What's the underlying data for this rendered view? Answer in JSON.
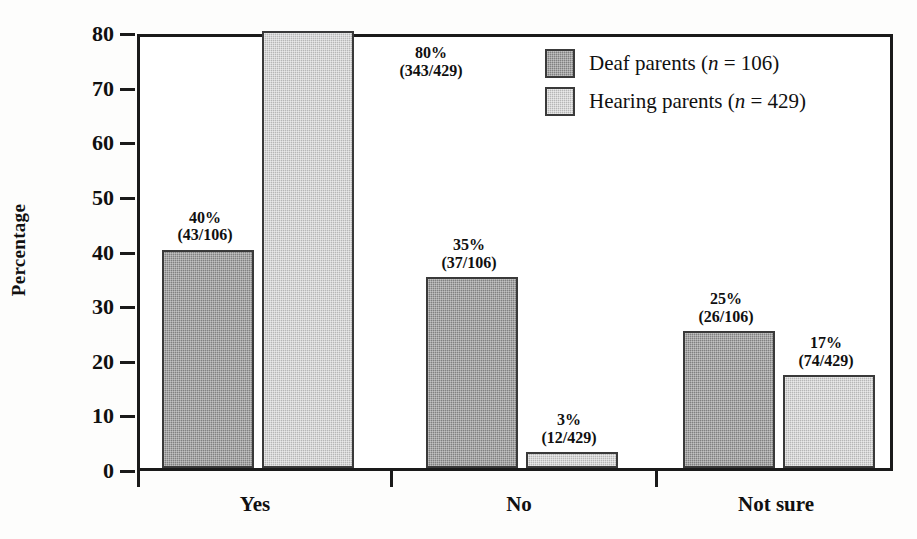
{
  "chart_data": {
    "type": "bar",
    "title": "",
    "subtitle": "",
    "xlabel": "",
    "ylabel": "Percentage",
    "ylim": [
      0,
      80
    ],
    "yticks": [
      0,
      10,
      20,
      30,
      40,
      50,
      60,
      70,
      80
    ],
    "ytick_labels": [
      "0",
      "10",
      "20",
      "30",
      "40",
      "50",
      "60",
      "70",
      "80"
    ],
    "grid": false,
    "legend_position": "top-right",
    "categories": [
      "Yes",
      "No",
      "Not sure"
    ],
    "series": [
      {
        "name": "Deaf parents",
        "n": 106,
        "legend_label": "Deaf parents (n = 106)",
        "color": "#808080",
        "values": [
          40,
          35,
          25
        ],
        "counts": [
          43,
          37,
          26
        ],
        "labels": [
          "40%",
          "35%",
          "25%"
        ],
        "fraction_labels": [
          "(43/106)",
          "(37/106)",
          "(26/106)"
        ]
      },
      {
        "name": "Hearing parents",
        "n": 429,
        "legend_label": "Hearing parents (n = 429)",
        "color": "#b6b6b6",
        "values": [
          80,
          3,
          17
        ],
        "counts": [
          343,
          12,
          74
        ],
        "labels": [
          "80%",
          "3%",
          "17%"
        ],
        "fraction_labels": [
          "(343/429)",
          "(12/429)",
          "(74/429)"
        ]
      }
    ]
  },
  "legend": {
    "entries": [
      {
        "text_before": "Deaf parents (",
        "italic": "n",
        "text_after": " = 106)"
      },
      {
        "text_before": "Hearing parents (",
        "italic": "n",
        "text_after": " = 429)"
      }
    ]
  },
  "axis": {
    "y_title": "Percentage"
  }
}
